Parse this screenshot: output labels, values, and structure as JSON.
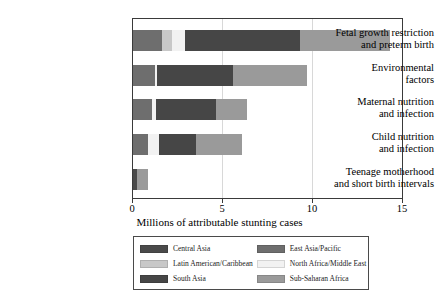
{
  "chart_data": {
    "type": "bar",
    "orientation": "horizontal",
    "stacked": true,
    "title": "",
    "xlabel": "Millions of attributable stunting cases",
    "ylabel": "",
    "xlim": [
      0,
      15
    ],
    "xticks": [
      0,
      5,
      10,
      15
    ],
    "xtick_labels": [
      "0",
      "5",
      "10",
      "15"
    ],
    "grid": false,
    "legend_position": "bottom",
    "categories": [
      "Fetal growth restriction and preterm birth",
      "Environmental factors",
      "Maternal nutrition and infection",
      "Child nutrition and infection",
      "Teenage motherhood and short birth intervals"
    ],
    "series": [
      {
        "name": "Central Asia",
        "color": "#4a4a4a",
        "values": [
          0.0,
          0.0,
          0.0,
          0.0,
          0.22
        ]
      },
      {
        "name": "East Asia/Pacific",
        "color": "#6e6e6e",
        "values": [
          1.6,
          1.2,
          1.05,
          0.85,
          0.0
        ]
      },
      {
        "name": "Latin American/Caribbean",
        "color": "#c8c8c8",
        "values": [
          0.55,
          0.0,
          0.0,
          0.0,
          0.0
        ]
      },
      {
        "name": "North Africa/Middle East",
        "color": "#f2f2f2",
        "values": [
          0.75,
          0.15,
          0.25,
          0.6,
          0.0
        ]
      },
      {
        "name": "South Asia",
        "color": "#464646",
        "values": [
          6.4,
          4.2,
          3.3,
          2.05,
          0.0
        ]
      },
      {
        "name": "Sub-Saharan Africa",
        "color": "#9a9a9a",
        "values": [
          5.0,
          4.1,
          1.75,
          2.55,
          0.6
        ]
      }
    ],
    "bars": [
      {
        "category": "Fetal growth restriction and preterm birth",
        "total": 14.3,
        "segments": [
          {
            "series": "East Asia/Pacific",
            "value": 1.6
          },
          {
            "series": "Latin American/Caribbean",
            "value": 0.55
          },
          {
            "series": "North Africa/Middle East",
            "value": 0.75
          },
          {
            "series": "South Asia",
            "value": 6.4
          },
          {
            "series": "Sub-Saharan Africa",
            "value": 5.0
          }
        ]
      },
      {
        "category": "Environmental factors",
        "total": 9.65,
        "segments": [
          {
            "series": "East Asia/Pacific",
            "value": 1.2
          },
          {
            "series": "North Africa/Middle East",
            "value": 0.15
          },
          {
            "series": "South Asia",
            "value": 4.2
          },
          {
            "series": "Sub-Saharan Africa",
            "value": 4.1
          }
        ]
      },
      {
        "category": "Maternal nutrition and infection",
        "total": 6.35,
        "segments": [
          {
            "series": "East Asia/Pacific",
            "value": 1.05
          },
          {
            "series": "North Africa/Middle East",
            "value": 0.25
          },
          {
            "series": "South Asia",
            "value": 3.3
          },
          {
            "series": "Sub-Saharan Africa",
            "value": 1.75
          }
        ]
      },
      {
        "category": "Child nutrition and infection",
        "total": 6.05,
        "segments": [
          {
            "series": "East Asia/Pacific",
            "value": 0.85
          },
          {
            "series": "North Africa/Middle East",
            "value": 0.6
          },
          {
            "series": "South Asia",
            "value": 2.05
          },
          {
            "series": "Sub-Saharan Africa",
            "value": 2.55
          }
        ]
      },
      {
        "category": "Teenage motherhood and short birth intervals",
        "total": 0.82,
        "segments": [
          {
            "series": "Central Asia",
            "value": 0.22
          },
          {
            "series": "Sub-Saharan Africa",
            "value": 0.6
          }
        ]
      }
    ]
  },
  "axis": {
    "xlabel": "Millions of attributable stunting cases",
    "ticks": [
      "0",
      "5",
      "10",
      "15"
    ]
  },
  "category_labels": [
    {
      "line1": "Fetal growth restriction",
      "line2": "and preterm birth"
    },
    {
      "line1": "Environmental",
      "line2": "factors"
    },
    {
      "line1": "Maternal nutrition",
      "line2": "and infection"
    },
    {
      "line1": "Child nutrition",
      "line2": "and infection"
    },
    {
      "line1": "Teenage motherhood",
      "line2": "and short birth intervals"
    }
  ],
  "legend": {
    "entries": [
      {
        "label": "Central Asia",
        "color": "#4a4a4a"
      },
      {
        "label": "East Asia/Pacific",
        "color": "#6e6e6e"
      },
      {
        "label": "Latin American/Caribbean",
        "color": "#c8c8c8"
      },
      {
        "label": "North Africa/Middle East",
        "color": "#f2f2f2"
      },
      {
        "label": "South Asia",
        "color": "#464646"
      },
      {
        "label": "Sub-Saharan Africa",
        "color": "#9a9a9a"
      }
    ]
  }
}
